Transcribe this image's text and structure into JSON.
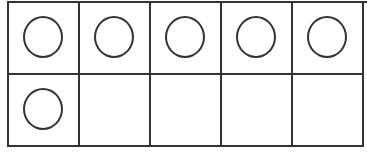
{
  "ten_frame": {
    "rows": 2,
    "columns": 5,
    "filled_count": 6,
    "cells": [
      {
        "row": 1,
        "col": 1,
        "counter": true
      },
      {
        "row": 1,
        "col": 2,
        "counter": true
      },
      {
        "row": 1,
        "col": 3,
        "counter": true
      },
      {
        "row": 1,
        "col": 4,
        "counter": true
      },
      {
        "row": 1,
        "col": 5,
        "counter": true
      },
      {
        "row": 2,
        "col": 1,
        "counter": true
      },
      {
        "row": 2,
        "col": 2,
        "counter": false
      },
      {
        "row": 2,
        "col": 3,
        "counter": false
      },
      {
        "row": 2,
        "col": 4,
        "counter": false
      },
      {
        "row": 2,
        "col": 5,
        "counter": false
      }
    ],
    "line_color": "#333333",
    "background_color": "#ffffff"
  }
}
